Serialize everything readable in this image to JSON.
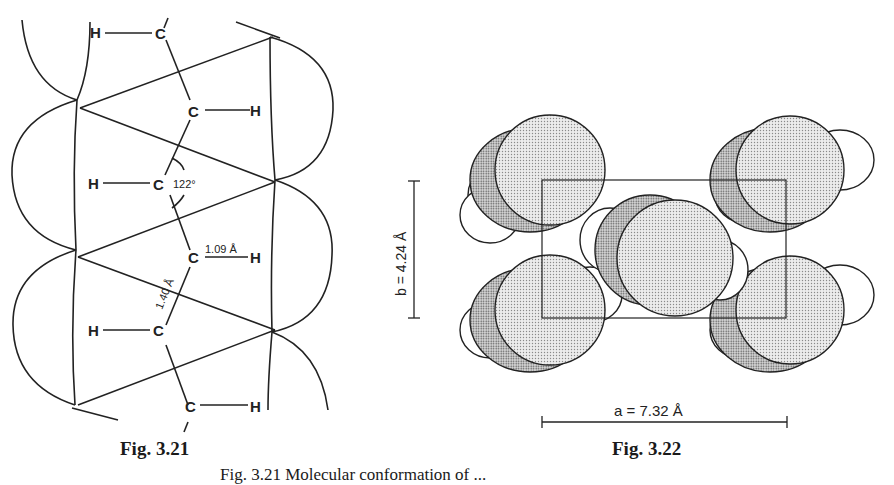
{
  "figures": {
    "left": {
      "label": "Fig. 3.21",
      "atoms": {
        "carbon": "C",
        "hydrogen": "H"
      },
      "angle_label": "122°",
      "ch_bond_label": "1.09 Å",
      "cc_bond_label": "1.40 Å"
    },
    "right": {
      "label": "Fig. 3.22",
      "axis_b_label": "b = 4.24 Å",
      "axis_a_label": "a = 7.32 Å"
    }
  },
  "caption_partial": "Fig. 3.21   Molecular conformation of ... "
}
